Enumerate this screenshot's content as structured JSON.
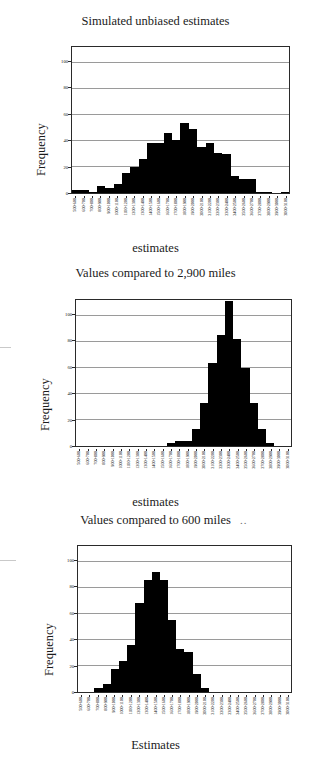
{
  "page": {
    "background": "#ffffff",
    "bar_color": "#000000",
    "grid_color": "#9a9a9a",
    "axis_color": "#2a2a2a"
  },
  "common": {
    "ylabel": "Frequency",
    "yticks": [
      0,
      20,
      40,
      60,
      80,
      100
    ],
    "ylim": [
      0,
      112
    ],
    "categories": [
      "500-600",
      "600-700",
      "700-800",
      "800-900",
      "900-1000",
      "1000-1100",
      "1100-1200",
      "1200-1300",
      "1300-1400",
      "1400-1500",
      "1500-1600",
      "1600-1700",
      "1700-1800",
      "1800-1900",
      "1900-2000",
      "2000-2100",
      "2100-2200",
      "2200-2300",
      "2300-2400",
      "2400-2500",
      "2500-2600",
      "2600-2700",
      "2700-2800",
      "2800-2900",
      "2900-3000",
      "3000-3100"
    ]
  },
  "charts": [
    {
      "id": "chart-simulated-unbiased",
      "title": "Simulated unbiased estimates",
      "xlabel": "estimates",
      "ylabel": "Frequency"
    },
    {
      "id": "chart-compared-2900",
      "title": "Values compared to 2,900 miles",
      "xlabel": "estimates",
      "ylabel": "Frequency"
    },
    {
      "id": "chart-compared-600",
      "title": "Values compared to 600 miles",
      "xlabel": "Estimates",
      "ylabel": "Frequency",
      "title_trailing": ".."
    }
  ],
  "chart_data": [
    {
      "type": "bar",
      "title": "Simulated unbiased estimates",
      "xlabel": "estimates",
      "ylabel": "Frequency",
      "ylim": [
        0,
        112
      ],
      "yticks": [
        0,
        20,
        40,
        60,
        80,
        100
      ],
      "grid": true,
      "legend": "none",
      "categories": [
        "500-600",
        "600-700",
        "700-800",
        "800-900",
        "900-1000",
        "1000-1100",
        "1100-1200",
        "1200-1300",
        "1300-1400",
        "1400-1500",
        "1500-1600",
        "1600-1700",
        "1700-1800",
        "1800-1900",
        "1900-2000",
        "2000-2100",
        "2100-2200",
        "2200-2300",
        "2300-2400",
        "2400-2500",
        "2500-2600",
        "2600-2700",
        "2700-2800",
        "2800-2900",
        "2900-3000",
        "3000-3100"
      ],
      "values": [
        2,
        2,
        1,
        5,
        4,
        7,
        15,
        20,
        26,
        38,
        38,
        46,
        41,
        54,
        49,
        35,
        38,
        31,
        30,
        13,
        11,
        11,
        1,
        1,
        0,
        1
      ]
    },
    {
      "type": "bar",
      "title": "Values compared to 2,900 miles",
      "xlabel": "estimates",
      "ylabel": "Frequency",
      "ylim": [
        0,
        112
      ],
      "yticks": [
        0,
        20,
        40,
        60,
        80,
        100
      ],
      "grid": true,
      "legend": "none",
      "categories": [
        "500-600",
        "600-700",
        "700-800",
        "800-900",
        "900-1000",
        "1000-1100",
        "1100-1200",
        "1200-1300",
        "1300-1400",
        "1400-1500",
        "1500-1600",
        "1600-1700",
        "1700-1800",
        "1800-1900",
        "1900-2000",
        "2000-2100",
        "2100-2200",
        "2200-2300",
        "2300-2400",
        "2400-2500",
        "2500-2600",
        "2600-2700",
        "2700-2800",
        "2800-2900",
        "2900-3000",
        "3000-3100"
      ],
      "values": [
        0,
        0,
        0,
        0,
        0,
        0,
        0,
        0,
        0,
        0,
        0,
        2,
        4,
        4,
        13,
        33,
        64,
        85,
        111,
        82,
        60,
        33,
        13,
        2,
        0,
        0
      ]
    },
    {
      "type": "bar",
      "title": "Values compared to 600 miles",
      "xlabel": "Estimates",
      "ylabel": "Frequency",
      "ylim": [
        0,
        112
      ],
      "yticks": [
        0,
        20,
        40,
        60,
        80,
        100
      ],
      "grid": true,
      "legend": "none",
      "categories": [
        "500-600",
        "600-700",
        "700-800",
        "800-900",
        "900-1000",
        "1000-1100",
        "1100-1200",
        "1200-1300",
        "1300-1400",
        "1400-1500",
        "1500-1600",
        "1600-1700",
        "1700-1800",
        "1800-1900",
        "1900-2000",
        "2000-2100",
        "2100-2200",
        "2200-2300",
        "2300-2400",
        "2400-2500",
        "2500-2600",
        "2600-2700",
        "2700-2800",
        "2800-2900",
        "2900-3000",
        "3000-3100"
      ],
      "values": [
        0,
        0,
        3,
        6,
        18,
        24,
        36,
        68,
        86,
        92,
        86,
        55,
        33,
        31,
        14,
        3,
        0,
        0,
        0,
        0,
        0,
        0,
        0,
        0,
        0,
        0
      ]
    }
  ]
}
